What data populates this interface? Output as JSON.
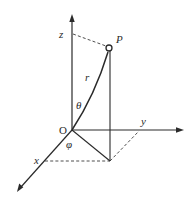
{
  "diagram": {
    "labels": {
      "z_axis": "z",
      "y_axis": "y",
      "x_axis": "x",
      "origin": "O",
      "point": "P",
      "radius": "r",
      "polar_angle": "θ",
      "azimuth_angle": "φ"
    },
    "colors": {
      "stroke": "#2a2a2a",
      "background": "#ffffff"
    }
  }
}
